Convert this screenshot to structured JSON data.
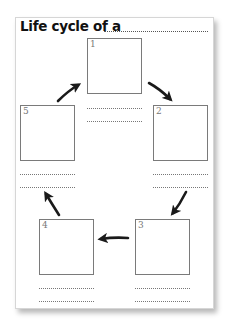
{
  "worksheet": {
    "title": "Life cycle of a",
    "title_blank": "",
    "stages": [
      {
        "number": "1",
        "line1": "",
        "line2": ""
      },
      {
        "number": "2",
        "line1": "",
        "line2": ""
      },
      {
        "number": "3",
        "line1": "",
        "line2": ""
      },
      {
        "number": "4",
        "line1": "",
        "line2": ""
      },
      {
        "number": "5",
        "line1": "",
        "line2": ""
      }
    ],
    "arrow_color": "#1a1a1a",
    "box_border_color": "#7a7a7a"
  }
}
